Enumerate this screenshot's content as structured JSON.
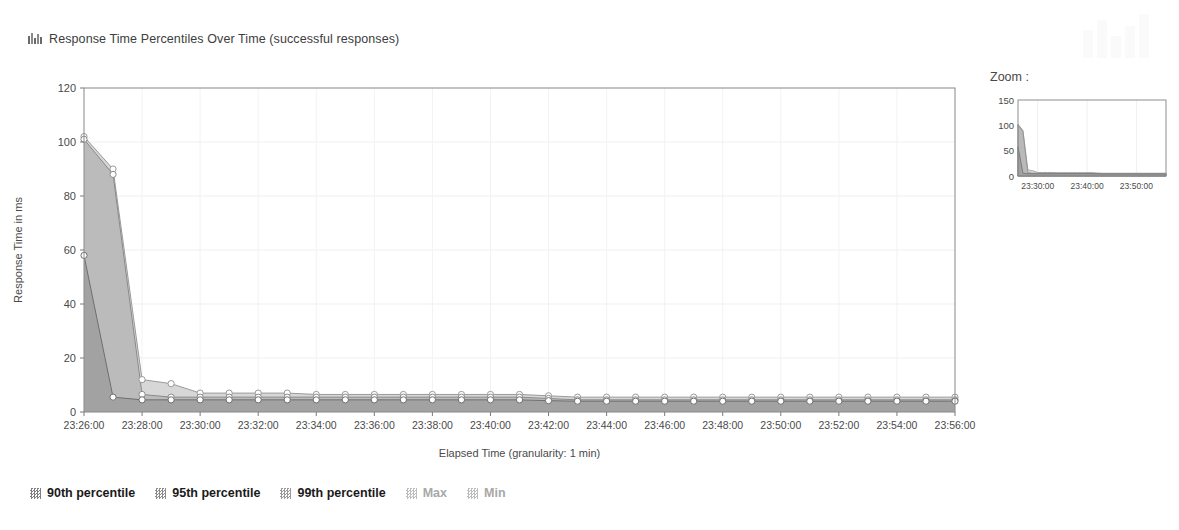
{
  "header": {
    "icon": "bar-chart-icon",
    "title": "Response Time Percentiles Over Time (successful responses)"
  },
  "zoom_panel": {
    "label": "Zoom :",
    "y_ticks": [
      "0",
      "50",
      "100",
      "150"
    ],
    "x_ticks": [
      "23:30:00",
      "23:40:00",
      "23:50:00"
    ]
  },
  "legend": {
    "items": [
      {
        "label": "90th percentile",
        "state": "active",
        "color": "#7f7f7f"
      },
      {
        "label": "95th percentile",
        "state": "active",
        "color": "#8c8c8c"
      },
      {
        "label": "99th percentile",
        "state": "active",
        "color": "#999999"
      },
      {
        "label": "Max",
        "state": "disabled",
        "color": "#bdbdbd"
      },
      {
        "label": "Min",
        "state": "disabled",
        "color": "#bdbdbd"
      }
    ]
  },
  "chart_data": {
    "type": "area",
    "title": "Response Time Percentiles Over Time (successful responses)",
    "xlabel": "Elapsed Time (granularity: 1 min)",
    "ylabel": "Response Time in ms",
    "ylim": [
      0,
      120
    ],
    "y_ticks": [
      0,
      20,
      40,
      60,
      80,
      100,
      120
    ],
    "grid": true,
    "legend_position": "bottom",
    "x": [
      "23:26:00",
      "23:27:00",
      "23:28:00",
      "23:29:00",
      "23:30:00",
      "23:31:00",
      "23:32:00",
      "23:33:00",
      "23:34:00",
      "23:35:00",
      "23:36:00",
      "23:37:00",
      "23:38:00",
      "23:39:00",
      "23:40:00",
      "23:41:00",
      "23:42:00",
      "23:43:00",
      "23:44:00",
      "23:45:00",
      "23:46:00",
      "23:47:00",
      "23:48:00",
      "23:49:00",
      "23:50:00",
      "23:51:00",
      "23:52:00",
      "23:53:00",
      "23:54:00",
      "23:55:00",
      "23:56:00"
    ],
    "x_tick_labels": [
      "23:26:00",
      "23:28:00",
      "23:30:00",
      "23:32:00",
      "23:34:00",
      "23:36:00",
      "23:38:00",
      "23:40:00",
      "23:42:00",
      "23:44:00",
      "23:46:00",
      "23:48:00",
      "23:50:00",
      "23:52:00",
      "23:54:00",
      "23:56:00"
    ],
    "series": [
      {
        "name": "99th percentile",
        "color": "#d0d0d0",
        "line_color": "#9a9a9a",
        "values": [
          102,
          90,
          12,
          10.5,
          7,
          7,
          7,
          7,
          6.5,
          6.5,
          6.5,
          6.5,
          6.5,
          6.5,
          6.5,
          6.5,
          6,
          5.5,
          5.5,
          5.5,
          5.5,
          5.5,
          5.5,
          5.5,
          5.5,
          5.5,
          5.5,
          5.5,
          5.5,
          5.5,
          5.5
        ]
      },
      {
        "name": "95th percentile",
        "color": "#b6b6b6",
        "line_color": "#8a8a8a",
        "values": [
          101,
          88,
          6.5,
          5.5,
          5.5,
          5.5,
          5.5,
          5.5,
          5.5,
          5.5,
          5.5,
          5.5,
          5.5,
          5.5,
          5.5,
          5.5,
          5,
          4.5,
          4.5,
          4.5,
          4.5,
          4.5,
          4.5,
          4.5,
          4.5,
          4.5,
          4.5,
          4.5,
          4.5,
          4.5,
          4.5
        ]
      },
      {
        "name": "90th percentile",
        "color": "#9e9e9e",
        "line_color": "#6f6f6f",
        "values": [
          58,
          5.5,
          4.5,
          4.5,
          4.5,
          4.5,
          4.5,
          4.5,
          4.5,
          4.5,
          4.5,
          4.5,
          4.5,
          4.5,
          4.5,
          4.5,
          4.2,
          4,
          4,
          4,
          4,
          4,
          4,
          4,
          4,
          4,
          4,
          4,
          4,
          4,
          4
        ]
      }
    ],
    "minimap": {
      "ylim": [
        0,
        150
      ],
      "y_ticks": [
        0,
        50,
        100,
        150
      ],
      "x_ticks": [
        "23:30:00",
        "23:40:00",
        "23:50:00"
      ]
    }
  }
}
